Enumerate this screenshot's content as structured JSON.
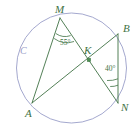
{
  "figure": {
    "canvas": {
      "width": 140,
      "height": 132
    },
    "colors": {
      "geometry_green": "#3f7244",
      "circle_lavender": "#9a9ec8",
      "background": "#ffffff",
      "point_marker": "#3f7244"
    },
    "circle": {
      "label": "C",
      "label_x": 20,
      "label_y": 54,
      "center_x": 71.5,
      "center_y": 68,
      "radius": 55
    },
    "points": [
      {
        "id": "M",
        "label": "M",
        "x": 60,
        "y": 18,
        "label_x": 55,
        "label_y": 13,
        "marker": false
      },
      {
        "id": "B",
        "label": "B",
        "x": 118,
        "y": 34,
        "label_x": 123,
        "label_y": 32,
        "marker": false
      },
      {
        "id": "K",
        "label": "K",
        "x": 89,
        "y": 60,
        "label_x": 85,
        "label_y": 54,
        "marker": true
      },
      {
        "id": "N",
        "label": "N",
        "x": 118,
        "y": 103,
        "label_x": 122,
        "label_y": 110,
        "marker": false
      },
      {
        "id": "A",
        "label": "A",
        "x": 32,
        "y": 103,
        "label_x": 26,
        "label_y": 116,
        "marker": false
      }
    ],
    "segments": [
      {
        "id": "MN",
        "from": "M",
        "to": "N",
        "x1": 60,
        "y1": 18,
        "x2": 118,
        "y2": 103
      },
      {
        "id": "AB",
        "from": "A",
        "to": "B",
        "x1": 32,
        "y1": 103,
        "x2": 118,
        "y2": 34
      },
      {
        "id": "MA",
        "from": "M",
        "to": "A",
        "x1": 60,
        "y1": 18,
        "x2": 32,
        "y2": 103
      },
      {
        "id": "BN",
        "from": "B",
        "to": "N",
        "x1": 118,
        "y1": 34,
        "x2": 118,
        "y2": 103
      }
    ],
    "angles": [
      {
        "id": "angle-M",
        "vertex": "M",
        "value": "55°",
        "label_x": 61,
        "label_y": 45,
        "arc_path": "M 55.5 33 A 16 16 0 0 0 72 35",
        "arc_path2": "M 53.5 38 A 21 21 0 0 0 75.5 40.5"
      },
      {
        "id": "angle-N",
        "vertex": "N",
        "value": "40°",
        "label_x": 106,
        "label_y": 71,
        "arc_path": "M 111 85 A 19 19 0 0 0 118 84",
        "arc_path2": "M 108.5 79.5 A 25 25 0 0 0 118 78"
      }
    ]
  }
}
